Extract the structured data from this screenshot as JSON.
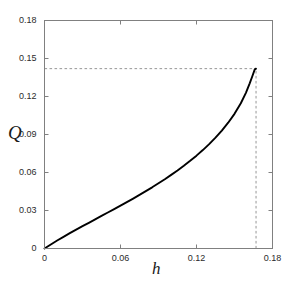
{
  "chart_data": {
    "type": "line",
    "title": "",
    "subtitle": "",
    "xlabel": "h",
    "ylabel": "Q",
    "xlim": [
      0,
      0.18
    ],
    "ylim": [
      0,
      0.18
    ],
    "xticks": [
      0,
      0.06,
      0.12,
      0.18
    ],
    "xticklabels": [
      "0",
      "0.06",
      "0.12",
      "0.18"
    ],
    "yticks": [
      0,
      0.03,
      0.06,
      0.09,
      0.12,
      0.15,
      0.18
    ],
    "yticklabels": [
      "0",
      "0.03",
      "0.06",
      "0.09",
      "0.12",
      "0.15",
      "0.18"
    ],
    "grid": false,
    "legend": null,
    "legend_position": "none",
    "line_color": "#000000",
    "line_width": 1.9,
    "frame_color": "#808080",
    "annotation_color": "#8a8a8a",
    "series": [
      {
        "name": "Q(h)",
        "x": [
          0.0,
          0.005,
          0.01,
          0.015,
          0.02,
          0.025,
          0.03,
          0.035,
          0.04,
          0.045,
          0.05,
          0.055,
          0.06,
          0.065,
          0.07,
          0.075,
          0.08,
          0.085,
          0.09,
          0.095,
          0.1,
          0.105,
          0.11,
          0.115,
          0.12,
          0.125,
          0.13,
          0.135,
          0.14,
          0.145,
          0.15,
          0.155,
          0.159,
          0.162,
          0.164,
          0.166,
          0.167
        ],
        "y": [
          0.0,
          0.0032,
          0.0063,
          0.0092,
          0.0121,
          0.0149,
          0.0176,
          0.0203,
          0.023,
          0.0257,
          0.0284,
          0.0311,
          0.0338,
          0.0366,
          0.0394,
          0.0423,
          0.0453,
          0.0483,
          0.0515,
          0.0547,
          0.0581,
          0.0616,
          0.0653,
          0.0692,
          0.0733,
          0.0777,
          0.0824,
          0.0875,
          0.0931,
          0.0993,
          0.1063,
          0.1147,
          0.1229,
          0.1304,
          0.1358,
          0.1414,
          0.142
        ]
      }
    ],
    "annotations": [
      {
        "name": "endpoint-guide-horizontal",
        "type": "dashed-line",
        "orientation": "horizontal",
        "value": 0.142,
        "from": 0,
        "to": 0.167
      },
      {
        "name": "endpoint-guide-vertical",
        "type": "dashed-line",
        "orientation": "vertical",
        "value": 0.167,
        "from": 0,
        "to": 0.142
      }
    ],
    "endpoint": {
      "x": 0.167,
      "y": 0.142
    }
  }
}
